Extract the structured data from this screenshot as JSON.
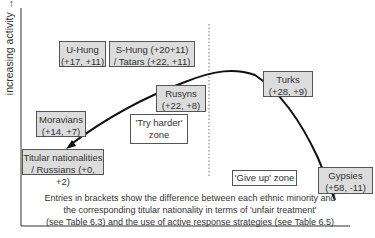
{
  "axis": {
    "ylabel": "increasing activity →"
  },
  "boxes": {
    "uhung": {
      "line1": "U-Hung",
      "line2": "(+17, +11)"
    },
    "shung": {
      "line1": "S-Hung (+20+11)",
      "line2": "/ Tatars (+22, +11)"
    },
    "rusyns": {
      "line1": "Rusyns",
      "line2": "(+22, +8)"
    },
    "turks": {
      "line1": "Turks",
      "line2": "(+28, +9)"
    },
    "moravians": {
      "line1": "Moravians",
      "line2": "(+14, +7)"
    },
    "titular": {
      "line1": "Titular nationalities",
      "line2": "/ Russians (+0, +2)"
    },
    "gypsies": {
      "line1": "Gypsies",
      "line2": "(+58, -11)"
    }
  },
  "zones": {
    "try_harder": {
      "line1": "'Try harder'",
      "line2": "zone"
    },
    "give_up": {
      "line1": "'Give up' zone"
    }
  },
  "caption": {
    "line1": "Entries in brackets show the difference between each ethnic minority and",
    "line2": "the corresponding titular nationality in terms of 'unfair treatment'",
    "line3": "(see Table 6.3) and the use of active response strategies (see Table 6.5)"
  },
  "colors": {
    "box_fill": "#dcdcdc",
    "line": "#111111"
  }
}
